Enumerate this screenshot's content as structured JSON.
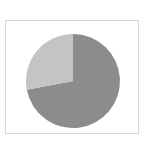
{
  "chart_data": {
    "type": "pie",
    "title": "",
    "labels": [
      "Slice A",
      "Slice B"
    ],
    "values": [
      72,
      28
    ],
    "colors": [
      "#8c8c8c",
      "#c4c4c4"
    ],
    "start_angle_deg": 0,
    "direction": "clockwise",
    "legend": "none"
  },
  "layout": {
    "center_x": 73,
    "center_y": 81,
    "radius": 47,
    "frame_color": "#d6d6d6"
  }
}
